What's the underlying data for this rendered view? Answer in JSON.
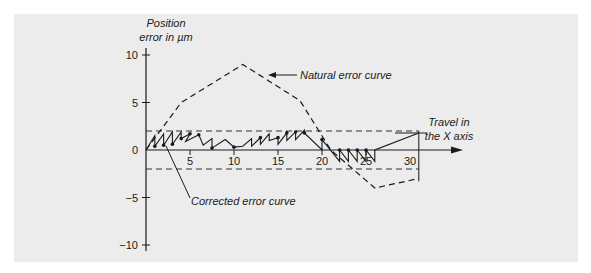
{
  "chart_data": {
    "type": "line",
    "ylabel_lines": [
      "Position",
      "error in µm"
    ],
    "xlabel_lines": [
      "Travel in",
      "the X axis"
    ],
    "xlim": [
      0,
      30
    ],
    "ylim": [
      -10,
      10
    ],
    "x_ticks": [
      {
        "value": 5,
        "label": "5"
      },
      {
        "value": 10,
        "label": "10"
      },
      {
        "value": 15,
        "label": "15"
      },
      {
        "value": 20,
        "label": "20"
      },
      {
        "value": 25,
        "label": "25"
      },
      {
        "value": 30,
        "label": "30"
      }
    ],
    "y_ticks": [
      {
        "value": 10,
        "label": "10"
      },
      {
        "value": 5,
        "label": "5"
      },
      {
        "value": 0,
        "label": "0"
      },
      {
        "value": -5,
        "label": "−5"
      },
      {
        "value": -10,
        "label": "−10"
      }
    ],
    "tolerance_band": [
      -2,
      2
    ],
    "series": [
      {
        "name": "Natural error curve",
        "style": "dashed",
        "points": [
          [
            0,
            0
          ],
          [
            4,
            5
          ],
          [
            11,
            9
          ],
          [
            17.5,
            5.2
          ],
          [
            21,
            0
          ],
          [
            26,
            -4
          ],
          [
            31,
            -3
          ]
        ]
      },
      {
        "name": "Corrected error curve",
        "style": "solid",
        "points": [
          [
            0,
            0
          ],
          [
            1,
            1.5
          ],
          [
            1,
            0.4
          ],
          [
            2,
            1.7
          ],
          [
            2,
            0.5
          ],
          [
            3,
            1.9
          ],
          [
            3,
            0.6
          ],
          [
            4,
            1.9
          ],
          [
            4,
            1.2
          ],
          [
            5,
            1.7
          ],
          [
            4.5,
            0.9
          ],
          [
            6,
            1.6
          ],
          [
            6.5,
            0.5
          ],
          [
            7.5,
            1.2
          ],
          [
            7.5,
            0.2
          ],
          [
            9,
            1.1
          ],
          [
            10,
            0.3
          ],
          [
            11,
            0.4
          ],
          [
            12,
            1.2
          ],
          [
            12,
            0.4
          ],
          [
            13,
            1.3
          ],
          [
            13,
            0.6
          ],
          [
            14,
            1.7
          ],
          [
            14,
            1.0
          ],
          [
            15,
            1.3
          ],
          [
            15,
            0.6
          ],
          [
            16,
            1.8
          ],
          [
            16,
            1.0
          ],
          [
            17,
            1.9
          ],
          [
            17,
            1.1
          ],
          [
            18,
            2.1
          ],
          [
            18,
            1.8
          ],
          [
            20,
            0.0
          ],
          [
            20,
            1.1
          ],
          [
            22,
            -1.2
          ],
          [
            22,
            0.0
          ],
          [
            23,
            -1.2
          ],
          [
            23,
            0.0
          ],
          [
            24,
            -1.2
          ],
          [
            24,
            0.0
          ],
          [
            25,
            -1.2
          ],
          [
            25,
            0.0
          ],
          [
            26,
            -1.2
          ],
          [
            26,
            0.0
          ],
          [
            31,
            1.8
          ]
        ],
        "markers": [
          [
            1,
            0.4
          ],
          [
            2,
            0.5
          ],
          [
            3,
            0.6
          ],
          [
            4,
            1.2
          ],
          [
            5,
            1.7
          ],
          [
            6,
            1.6
          ],
          [
            7.5,
            0.2
          ],
          [
            10,
            0.3
          ],
          [
            13,
            1.3
          ],
          [
            15,
            1.3
          ],
          [
            16,
            1.8
          ],
          [
            17,
            1.9
          ],
          [
            18,
            1.8
          ],
          [
            20,
            1.1
          ],
          [
            22,
            0.0
          ],
          [
            23,
            0.0
          ],
          [
            24,
            0.0
          ],
          [
            25,
            0.0
          ]
        ]
      }
    ],
    "annotations": [
      {
        "text": "Natural error curve",
        "target": "natural"
      },
      {
        "text": "Corrected error curve",
        "target": "corrected"
      }
    ]
  }
}
